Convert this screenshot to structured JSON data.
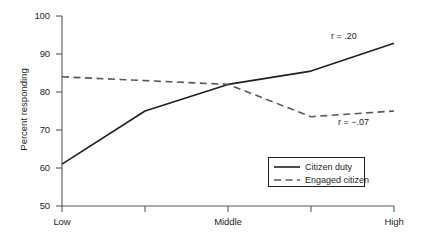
{
  "chart_data": {
    "type": "line",
    "title": "",
    "xlabel": "",
    "ylabel": "Percent responding",
    "ylim": [
      50,
      100
    ],
    "yticks": [
      50,
      60,
      70,
      80,
      90,
      100
    ],
    "ytick_labels": [
      "50",
      "60",
      "70",
      "80",
      "90",
      "100"
    ],
    "grid": false,
    "legend_position": "lower-right-inside",
    "categories": [
      "Low",
      "",
      "Middle",
      "",
      "High"
    ],
    "xtick_labels": [
      "Low",
      "",
      "Middle",
      "",
      "High"
    ],
    "x": [
      1,
      2,
      3,
      4,
      5
    ],
    "series": [
      {
        "name": "Citizen duty",
        "style": "solid",
        "color": "#231f20",
        "values": [
          61,
          75,
          82,
          85.5,
          92.8
        ],
        "annotation": "r = .20"
      },
      {
        "name": "Engaged citizen",
        "style": "dashed",
        "color": "#58595b",
        "values": [
          84,
          83,
          82,
          73.5,
          75
        ],
        "annotation": "r = −.07"
      }
    ],
    "annotations": [
      {
        "text": "r = .20",
        "x": 4.15,
        "y": 91.5
      },
      {
        "text": "r = −.07",
        "x": 4.35,
        "y": 69.5
      }
    ]
  },
  "legend": {
    "items": [
      {
        "label": "Citizen duty",
        "style": "solid"
      },
      {
        "label": "Engaged citizen",
        "style": "dashed"
      }
    ]
  },
  "axes": {
    "y_title": "Percent responding"
  }
}
